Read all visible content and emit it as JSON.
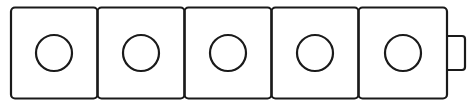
{
  "diagram": {
    "stroke_color": "#1a1a1a",
    "background": "#ffffff",
    "cell_count": 5,
    "cells": [
      {
        "index": 1,
        "shape": "circle"
      },
      {
        "index": 2,
        "shape": "circle"
      },
      {
        "index": 3,
        "shape": "circle"
      },
      {
        "index": 4,
        "shape": "circle"
      },
      {
        "index": 5,
        "shape": "circle"
      }
    ],
    "end_tab": {
      "side": "right"
    }
  }
}
